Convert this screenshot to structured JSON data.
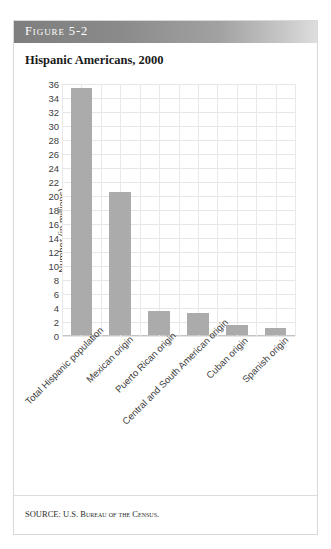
{
  "figure": {
    "header_label": "Figure 5-2",
    "title": "Hispanic Americans, 2000",
    "source": "SOURCE: U.S. Bureau of the Census."
  },
  "colors": {
    "bar": "#ababab",
    "header_dark": "#7e7e7e",
    "header_light": "#dedede",
    "gridline": "#e6e6e6",
    "text": "#3d3d3d"
  },
  "chart_data": {
    "type": "bar",
    "title": "Hispanic Americans, 2000",
    "xlabel": "",
    "ylabel": "Number (in millions)",
    "ylim": [
      0,
      36
    ],
    "ytick_step": 2,
    "yticks": [
      36,
      34,
      32,
      30,
      28,
      26,
      24,
      22,
      20,
      18,
      16,
      14,
      12,
      10,
      8,
      6,
      4,
      2,
      0
    ],
    "grid": true,
    "legend": null,
    "categories": [
      "Total Hispanic population",
      "Mexican origin",
      "Puerto Rican origin",
      "Central and South American origin",
      "Cuban origin",
      "Spanish origin"
    ],
    "values": [
      35.3,
      20.4,
      3.5,
      3.1,
      1.5,
      1.0
    ],
    "units": "millions"
  }
}
